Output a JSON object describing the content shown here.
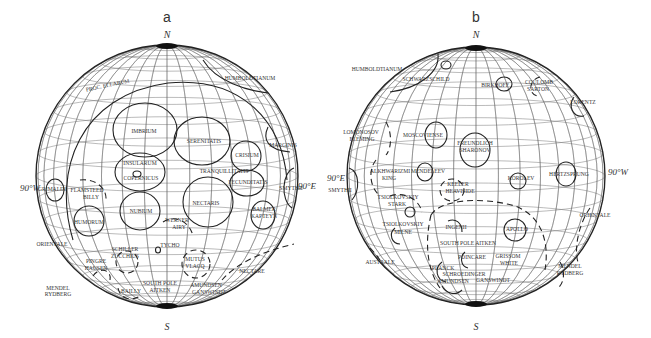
{
  "figure": {
    "panels": [
      {
        "id": "a",
        "label": "a",
        "north": "N",
        "south": "S",
        "west_label": "90°W",
        "east_label": "90°E",
        "center": [
          167,
          176
        ],
        "radius": 131,
        "basins": [
          {
            "name": "PROC. ELLARUM",
            "x": 108,
            "y": 87,
            "rot": -12
          },
          {
            "name": "HUMBOLDTIANUM",
            "x": 250,
            "y": 80
          },
          {
            "name": "IMBRIUM",
            "x": 144,
            "y": 133
          },
          {
            "name": "SERENITATIS",
            "x": 204,
            "y": 143
          },
          {
            "name": "MARGINIS",
            "x": 283,
            "y": 147
          },
          {
            "name": "CRISIUM",
            "x": 247,
            "y": 157
          },
          {
            "name": "INSULARUM",
            "x": 140,
            "y": 165
          },
          {
            "name": "COPERNICUS",
            "x": 141,
            "y": 180
          },
          {
            "name": "TRANQUILLITATIS",
            "x": 224,
            "y": 173
          },
          {
            "name": "FECUNDITATIS",
            "x": 248,
            "y": 184
          },
          {
            "name": "SMYTHII",
            "x": 291,
            "y": 190
          },
          {
            "name": "GRIMALDI",
            "x": 52,
            "y": 191
          },
          {
            "name": "FLAMSTEED",
            "x": 87,
            "y": 192
          },
          {
            "name": "BILLY",
            "x": 91,
            "y": 199
          },
          {
            "name": "NECTARIS",
            "x": 206,
            "y": 205
          },
          {
            "name": "BALMER",
            "x": 264,
            "y": 211
          },
          {
            "name": "KAPTEYN",
            "x": 264,
            "y": 218
          },
          {
            "name": "NUBIUM",
            "x": 141,
            "y": 213
          },
          {
            "name": "WERNER",
            "x": 177,
            "y": 222
          },
          {
            "name": "AIRY",
            "x": 179,
            "y": 229
          },
          {
            "name": "HUMORUM",
            "x": 89,
            "y": 224
          },
          {
            "name": "ORIENTALE",
            "x": 52,
            "y": 246
          },
          {
            "name": "TYCHO",
            "x": 170,
            "y": 247
          },
          {
            "name": "SCHILLER",
            "x": 125,
            "y": 251
          },
          {
            "name": "ZUCCHIUS",
            "x": 125,
            "y": 258
          },
          {
            "name": "MUTUS",
            "x": 195,
            "y": 261
          },
          {
            "name": "VLACQ",
            "x": 195,
            "y": 268
          },
          {
            "name": "PINGRE",
            "x": 96,
            "y": 263
          },
          {
            "name": "HAUSEN",
            "x": 96,
            "y": 270
          },
          {
            "name": "NECTARE",
            "x": 252,
            "y": 273
          },
          {
            "name": "MENDEL",
            "x": 58,
            "y": 290
          },
          {
            "name": "RYDBERG",
            "x": 58,
            "y": 296
          },
          {
            "name": "SOUTH POLE",
            "x": 160,
            "y": 285
          },
          {
            "name": "AITKEN",
            "x": 160,
            "y": 292
          },
          {
            "name": "BAILLY",
            "x": 131,
            "y": 293
          },
          {
            "name": "AMUNDSEN",
            "x": 206,
            "y": 287
          },
          {
            "name": "GANSWINDT",
            "x": 209,
            "y": 294
          }
        ]
      },
      {
        "id": "b",
        "label": "b",
        "north": "N",
        "south": "S",
        "west_label": "90°W",
        "east_label": "90°E",
        "center": [
          476,
          176
        ],
        "radius": 129,
        "basins": [
          {
            "name": "HUMBOLDTIANUM",
            "x": 377,
            "y": 71
          },
          {
            "name": "SCHWARZSCHILD",
            "x": 426,
            "y": 81
          },
          {
            "name": "BIRKHOFF",
            "x": 495,
            "y": 87
          },
          {
            "name": "COULOMB",
            "x": 539,
            "y": 84
          },
          {
            "name": "SARTON",
            "x": 538,
            "y": 91
          },
          {
            "name": "LORENTZ",
            "x": 583,
            "y": 104
          },
          {
            "name": "LOMONOSOV",
            "x": 361,
            "y": 134
          },
          {
            "name": "FLEMING",
            "x": 362,
            "y": 141
          },
          {
            "name": "MOSCOVIENSE",
            "x": 423,
            "y": 137
          },
          {
            "name": "FREUNDLICH",
            "x": 475,
            "y": 145
          },
          {
            "name": "SHARONOV",
            "x": 475,
            "y": 152
          },
          {
            "name": "HERTZSPRUNG",
            "x": 569,
            "y": 176
          },
          {
            "name": "SMYTHII",
            "x": 340,
            "y": 192
          },
          {
            "name": "ALKHWARIZMI",
            "x": 390,
            "y": 173
          },
          {
            "name": "KING",
            "x": 389,
            "y": 180
          },
          {
            "name": "MENDELEEV",
            "x": 428,
            "y": 173
          },
          {
            "name": "KOROLEV",
            "x": 521,
            "y": 180
          },
          {
            "name": "KEELER",
            "x": 458,
            "y": 186
          },
          {
            "name": "HEAVISIDE",
            "x": 460,
            "y": 193
          },
          {
            "name": "TSIOLKOVSKIY",
            "x": 398,
            "y": 199
          },
          {
            "name": "STARK",
            "x": 397,
            "y": 206
          },
          {
            "name": "ORIENTALE",
            "x": 595,
            "y": 217
          },
          {
            "name": "TSIOLKOVSKIY",
            "x": 403,
            "y": 226
          },
          {
            "name": "INGENII",
            "x": 456,
            "y": 229
          },
          {
            "name": "MILNE",
            "x": 403,
            "y": 234
          },
          {
            "name": "APOLLO",
            "x": 517,
            "y": 231
          },
          {
            "name": "SOUTH POLE AITKEN",
            "x": 468,
            "y": 245
          },
          {
            "name": "AUSTRALE",
            "x": 380,
            "y": 264
          },
          {
            "name": "POINCARE",
            "x": 472,
            "y": 259
          },
          {
            "name": "GRISSOM",
            "x": 508,
            "y": 258
          },
          {
            "name": "WHITE",
            "x": 509,
            "y": 265
          },
          {
            "name": "PLANCK",
            "x": 443,
            "y": 270
          },
          {
            "name": "SCHROEDINGER",
            "x": 464,
            "y": 276
          },
          {
            "name": "AMUNDSEN",
            "x": 453,
            "y": 283
          },
          {
            "name": "GANSWINDT",
            "x": 493,
            "y": 282
          },
          {
            "name": "MENDEL",
            "x": 570,
            "y": 268
          },
          {
            "name": "RYDBERG",
            "x": 570,
            "y": 275
          }
        ]
      }
    ]
  }
}
